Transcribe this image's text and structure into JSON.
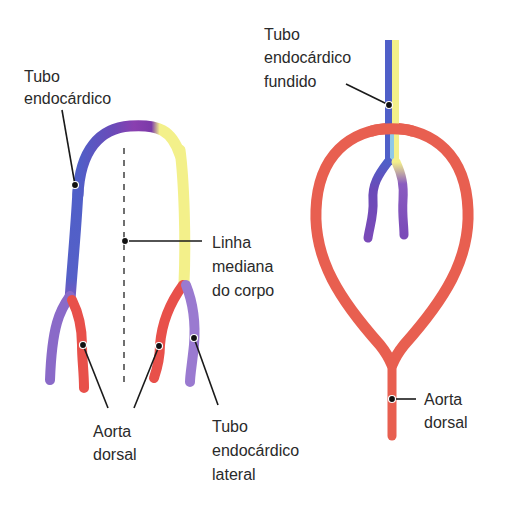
{
  "colors": {
    "blue": "#4f5fc8",
    "purple": "#8a5cc0",
    "violet": "#6a3aa8",
    "yellow": "#f3f08a",
    "red": "#e8564a",
    "aorta": "#e85f50",
    "light_blue": "#8ec8e8",
    "magenta": "#9a3aa8"
  },
  "left_panel": {
    "labels": {
      "endocardial_tube": [
        "Tubo",
        "endocárdico"
      ],
      "midline": [
        "Linha",
        "mediana",
        "do corpo"
      ],
      "dorsal_aorta": [
        "Aorta",
        "dorsal"
      ],
      "lateral_tube": [
        "Tubo",
        "endocárdico",
        "lateral"
      ]
    }
  },
  "right_panel": {
    "labels": {
      "fused_tube": [
        "Tubo",
        "endocárdico",
        "fundido"
      ],
      "dorsal_aorta": [
        "Aorta",
        "dorsal"
      ]
    }
  }
}
